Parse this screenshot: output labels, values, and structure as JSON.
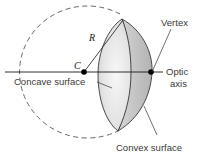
{
  "diagram": {
    "type": "spherical-mirror-geometry",
    "labels": {
      "radius": "R",
      "center": "C",
      "vertex": "Vertex",
      "optic_axis_line1": "Optic",
      "optic_axis_line2": "axis",
      "concave_surface": "Concave surface",
      "convex_surface": "Convex surface"
    },
    "colors": {
      "line": "#1a1a1a",
      "dashed_circle": "#555555",
      "shell_dark": "#b9b9b9",
      "shell_light": "#efefef",
      "text": "#3a3a3a"
    }
  }
}
